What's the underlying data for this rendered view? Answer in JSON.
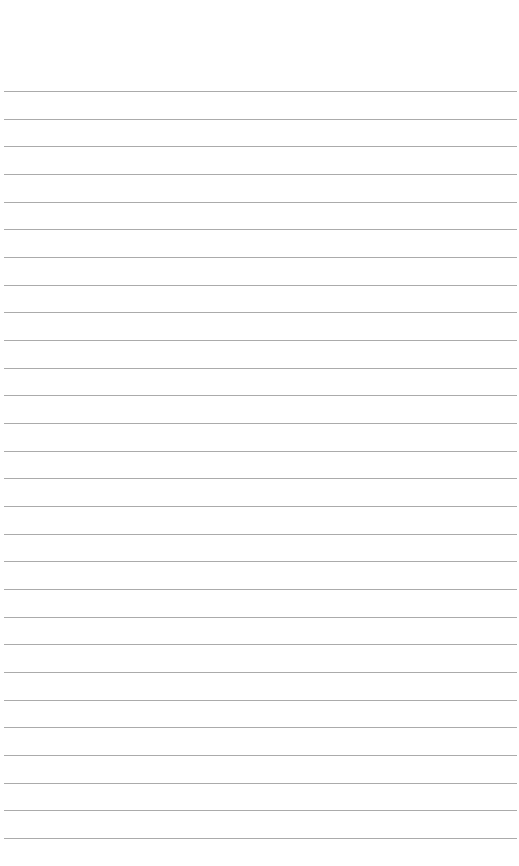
{
  "page": {
    "type": "ruled-paper",
    "background_color": "#ffffff",
    "rule_color": "#9c9c9c",
    "line_count": 28,
    "text_content": []
  }
}
